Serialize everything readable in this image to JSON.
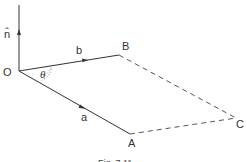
{
  "figure": {
    "caption": "Fig. 7.11",
    "points": {
      "O": {
        "label": "O"
      },
      "A": {
        "label": "A"
      },
      "B": {
        "label": "B"
      },
      "C": {
        "label": "C"
      }
    },
    "vectors": {
      "n": {
        "label": "n̂"
      },
      "a": {
        "label": "a"
      },
      "b": {
        "label": "b"
      }
    },
    "angle": {
      "label": "θ"
    },
    "colors": {
      "line": "#333333",
      "dashed": "#555555",
      "background": "#ffffff"
    }
  }
}
